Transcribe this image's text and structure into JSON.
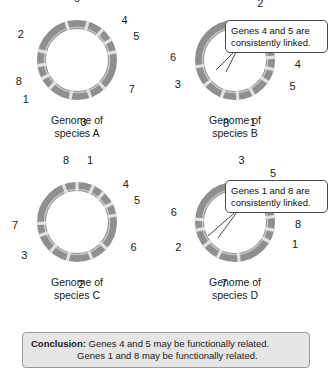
{
  "figure": {
    "ring_color": "#8f8f8f",
    "gap_color": "#e2e2e2",
    "inner_line_color": "#c9c9c9"
  },
  "genomes": [
    {
      "id": "a",
      "caption": "Genome of\nspecies A",
      "genes": [
        {
          "number": "6",
          "angle": -90,
          "label_r": 62
        },
        {
          "number": "4",
          "angle": -40,
          "label_r": 62
        },
        {
          "number": "5",
          "angle": -22,
          "label_r": 64
        },
        {
          "number": "7",
          "angle": 28,
          "label_r": 62
        },
        {
          "number": "3",
          "angle": 84,
          "label_r": 62
        },
        {
          "number": "1",
          "angle": 143,
          "label_r": 64
        },
        {
          "number": "8",
          "angle": 160,
          "label_r": 62
        },
        {
          "number": "2",
          "angle": -155,
          "label_r": 62
        }
      ],
      "boundaries": [
        -106,
        -74,
        -50,
        -31,
        -12,
        46,
        70,
        100,
        134,
        152,
        172,
        -166
      ]
    },
    {
      "id": "b",
      "caption": "Genome of\nspecies B",
      "genes": [
        {
          "number": "2",
          "angle": -66,
          "label_r": 62
        },
        {
          "number": "7",
          "angle": -27,
          "label_r": 62
        },
        {
          "number": "4",
          "angle": 4,
          "label_r": 63
        },
        {
          "number": "5",
          "angle": 24,
          "label_r": 63
        },
        {
          "number": "1",
          "angle": 74,
          "label_r": 64
        },
        {
          "number": "8",
          "angle": 98,
          "label_r": 64
        },
        {
          "number": "3",
          "angle": 157,
          "label_r": 62
        },
        {
          "number": "6",
          "angle": -177,
          "label_r": 62
        }
      ],
      "boundaries": [
        -80,
        -50,
        -38,
        -16,
        -4,
        14,
        34,
        62,
        86,
        110,
        140,
        170
      ]
    },
    {
      "id": "c",
      "caption": "Genome of\nspecies C",
      "genes": [
        {
          "number": "1",
          "angle": -78,
          "label_r": 63
        },
        {
          "number": "4",
          "angle": -38,
          "label_r": 62
        },
        {
          "number": "5",
          "angle": -20,
          "label_r": 64
        },
        {
          "number": "6",
          "angle": 24,
          "label_r": 62
        },
        {
          "number": "2",
          "angle": 86,
          "label_r": 62
        },
        {
          "number": "3",
          "angle": 148,
          "label_r": 62
        },
        {
          "number": "7",
          "angle": 177,
          "label_r": 62
        },
        {
          "number": "8",
          "angle": -100,
          "label_r": 63
        }
      ],
      "boundaries": [
        -110,
        -90,
        -66,
        -48,
        -28,
        -10,
        42,
        68,
        104,
        132,
        160,
        178
      ]
    },
    {
      "id": "d",
      "caption": "Genome of\nspecies D",
      "genes": [
        {
          "number": "3",
          "angle": -84,
          "label_r": 62
        },
        {
          "number": "5",
          "angle": -52,
          "label_r": 62
        },
        {
          "number": "4",
          "angle": -32,
          "label_r": 63
        },
        {
          "number": "8",
          "angle": 2,
          "label_r": 63
        },
        {
          "number": "1",
          "angle": 20,
          "label_r": 64
        },
        {
          "number": "7",
          "angle": 100,
          "label_r": 62
        },
        {
          "number": "2",
          "angle": 156,
          "label_r": 62
        },
        {
          "number": "6",
          "angle": -171,
          "label_r": 62
        }
      ],
      "boundaries": [
        -100,
        -70,
        -42,
        -24,
        -8,
        12,
        30,
        84,
        116,
        142,
        168,
        -176
      ]
    }
  ],
  "callouts": [
    {
      "id": "genes-4-5",
      "text": "Genes 4 and 5 are\nconsistently linked."
    },
    {
      "id": "genes-1-8",
      "text": "Genes 1 and 8 are\nconsistently linked."
    }
  ],
  "conclusion": {
    "lead": "Conclusion:",
    "line1": " Genes 4 and 5 may be functionally related.",
    "line2": "Genes 1 and 8 may be functionally related."
  }
}
